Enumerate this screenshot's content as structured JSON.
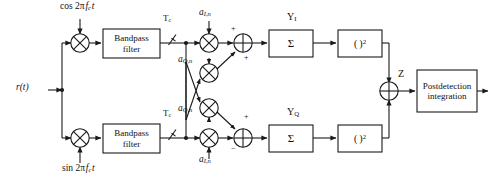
{
  "diagram": {
    "stroke_color": "#1a1a1a",
    "text_color": "#111111",
    "background": "#ffffff"
  },
  "input": {
    "label": "r(t)",
    "name": "received-signal"
  },
  "carriers": {
    "upper": {
      "prefix": "cos 2",
      "pi": "π",
      "freq": "f",
      "freq_sub": "c",
      "time": "t",
      "full": "cos 2π f_c t"
    },
    "lower": {
      "prefix": "sin 2",
      "pi": "π",
      "freq": "f",
      "freq_sub": "c",
      "time": "t",
      "full": "sin 2π f_c t"
    }
  },
  "blocks": {
    "bandpass_upper": {
      "line1": "Bandpass",
      "line2": "filter"
    },
    "bandpass_lower": {
      "line1": "Bandpass",
      "line2": "filter"
    },
    "sum_upper": {
      "label": "Σ"
    },
    "sum_lower": {
      "label": "Σ"
    },
    "square_upper": {
      "label": "( )²"
    },
    "square_lower": {
      "label": "( )²"
    },
    "postdetection": {
      "line1": "Postdetection",
      "line2": "integration"
    }
  },
  "switches": {
    "upper": {
      "label": "T",
      "sub": "c"
    },
    "lower": {
      "label": "T",
      "sub": "c"
    }
  },
  "despread_codes": {
    "upper_top": {
      "base": "a",
      "sub": "I,n"
    },
    "upper_bottom": {
      "base": "a",
      "sub": "Q,n"
    },
    "lower_top": {
      "base": "a",
      "sub": "Q,n"
    },
    "lower_bottom": {
      "base": "a",
      "sub": "I,n"
    }
  },
  "signals": {
    "y_upper": {
      "base": "Y",
      "sub": "I"
    },
    "y_lower": {
      "base": "Y",
      "sub": "Q"
    },
    "z": {
      "base": "Z"
    }
  },
  "adders": {
    "upper": {
      "sign_top": "+",
      "sign_bottom": "+"
    },
    "lower": {
      "sign_top": "+",
      "sign_bottom": "−"
    },
    "final": {
      "sign_top": "+",
      "sign_bottom": "+"
    }
  },
  "icons": {
    "multiplier": "multiplier-circle-x-icon",
    "adder": "adder-circle-plus-icon",
    "switch": "sampling-switch-icon",
    "arrow": "arrow-head-icon"
  }
}
